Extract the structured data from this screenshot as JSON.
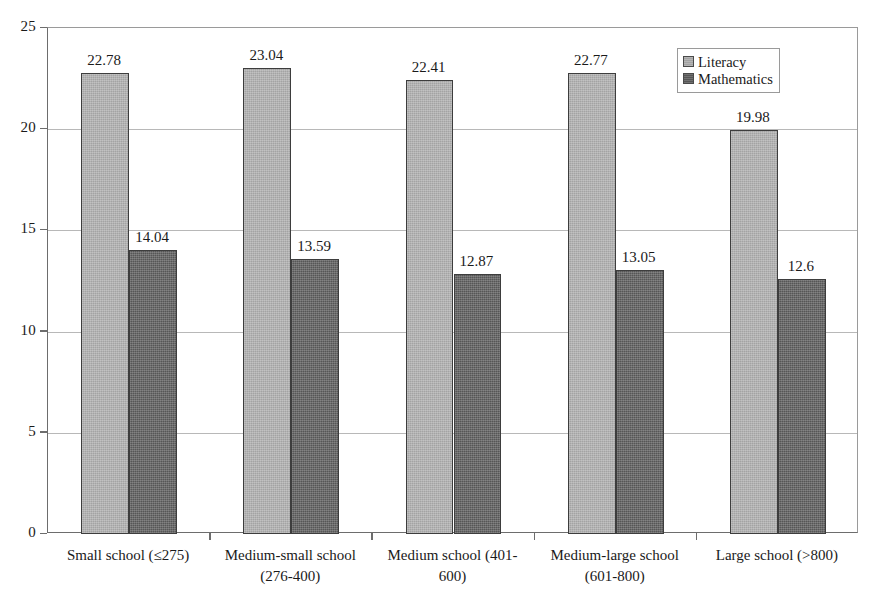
{
  "chart_data": {
    "type": "bar",
    "title": "",
    "subtitle": "",
    "xlabel": "",
    "ylabel": "",
    "ylim": [
      0,
      25
    ],
    "yticks": [
      0,
      5,
      10,
      15,
      20,
      25
    ],
    "ytick_labels": [
      "0",
      "5",
      "10",
      "15",
      "20",
      "25"
    ],
    "grid": true,
    "legend_position": "top-right",
    "categories": [
      "Small school (≤275)",
      "Medium-small school\n(276-400)",
      "Medium school (401-\n600)",
      "Medium-large school\n(601-800)",
      "Large school (>800)"
    ],
    "series": [
      {
        "name": "Literacy",
        "color": "#a3a3a3",
        "values": [
          22.78,
          23.04,
          22.41,
          22.77,
          19.98
        ],
        "value_labels": [
          "22.78",
          "23.04",
          "22.41",
          "22.77",
          "19.98"
        ]
      },
      {
        "name": "Mathematics",
        "color": "#565656",
        "values": [
          14.04,
          13.59,
          12.87,
          13.05,
          12.6
        ],
        "value_labels": [
          "14.04",
          "13.59",
          "12.87",
          "13.05",
          "12.6"
        ]
      }
    ]
  },
  "legend": {
    "entries": [
      {
        "label": "Literacy",
        "swatch": "literacy"
      },
      {
        "label": "Mathematics",
        "swatch": "mathematics"
      }
    ]
  },
  "colors": {
    "literacy": "#a3a3a3",
    "mathematics": "#565656",
    "axis": "#6d6d6d",
    "grid": "#b8b8b8",
    "text": "#1a1a1a",
    "background": "#ffffff"
  }
}
